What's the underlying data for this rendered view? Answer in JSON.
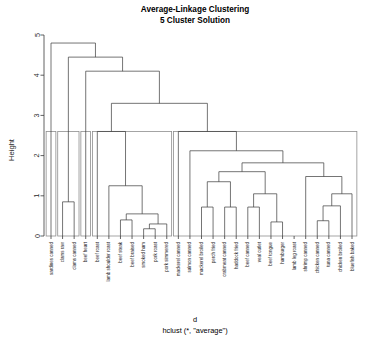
{
  "title": {
    "line1": "Average-Linkage Clustering",
    "line2": "5 Cluster Solution"
  },
  "footer": {
    "xlabel": "d",
    "method": "hclust (*, \"average\")"
  },
  "colors": {
    "branch": "#3a3a3a",
    "cluster_box": "#8e8e8e",
    "axis": "#3a3a3a",
    "text": "#000000",
    "background": "#ffffff"
  },
  "chart_data": {
    "type": "dendrogram",
    "xlabel": "d",
    "ylabel": "Height",
    "ylim": [
      0,
      5
    ],
    "yticks": [
      0,
      1,
      2,
      3,
      4,
      5
    ],
    "grid": false,
    "legend": "none",
    "linkage": "average",
    "n_clusters": 5,
    "n_leaves": 27,
    "cut_height": 2.6,
    "leaves": [
      "sardines canned",
      "clams raw",
      "clams canned",
      "beef heart",
      "beef roast",
      "lamb shoulder roast",
      "beef steak",
      "beef braised",
      "smoked ham",
      "pork roast",
      "pork simmered",
      "mackerel canned",
      "salmon canned",
      "mackerel broiled",
      "perch fried",
      "crabmeat canned",
      "haddock fried",
      "beef canned",
      "veal cutlet",
      "beef tongue",
      "hamburger",
      "lamb leg roast",
      "shrimp canned",
      "chicken canned",
      "tuna canned",
      "chicken broiled",
      "bluefish baked"
    ],
    "clusters": [
      {
        "id": 1,
        "label": "cluster-1",
        "leaf_start": 0,
        "leaf_end": 0,
        "members": [
          "sardines canned"
        ]
      },
      {
        "id": 2,
        "label": "cluster-2",
        "leaf_start": 1,
        "leaf_end": 2,
        "members": [
          "clams raw",
          "clams canned"
        ]
      },
      {
        "id": 3,
        "label": "cluster-3",
        "leaf_start": 3,
        "leaf_end": 3,
        "members": [
          "beef heart"
        ]
      },
      {
        "id": 4,
        "label": "cluster-4",
        "leaf_start": 4,
        "leaf_end": 10,
        "members": [
          "beef roast",
          "lamb shoulder roast",
          "beef steak",
          "beef braised",
          "smoked ham",
          "pork roast",
          "pork simmered"
        ]
      },
      {
        "id": 5,
        "label": "cluster-5",
        "leaf_start": 11,
        "leaf_end": 26,
        "members": [
          "mackerel canned",
          "salmon canned",
          "mackerel broiled",
          "perch fried",
          "crabmeat canned",
          "haddock fried",
          "beef canned",
          "veal cutlet",
          "beef tongue",
          "hamburger",
          "lamb leg roast",
          "shrimp canned",
          "chicken canned",
          "tuna canned",
          "chicken broiled",
          "bluefish baked"
        ]
      }
    ],
    "merges": [
      {
        "id": "m1",
        "left": {
          "type": "leaf",
          "index": 1
        },
        "right": {
          "type": "leaf",
          "index": 2
        },
        "height": 0.85
      },
      {
        "id": "m2",
        "left": {
          "type": "leaf",
          "index": 6
        },
        "right": {
          "type": "leaf",
          "index": 7
        },
        "height": 0.4
      },
      {
        "id": "m3",
        "left": {
          "type": "leaf",
          "index": 8
        },
        "right": {
          "type": "leaf",
          "index": 9
        },
        "height": 0.18
      },
      {
        "id": "m4",
        "left": {
          "type": "node",
          "ref": "m3"
        },
        "right": {
          "type": "leaf",
          "index": 10
        },
        "height": 0.3
      },
      {
        "id": "m5",
        "left": {
          "type": "node",
          "ref": "m2"
        },
        "right": {
          "type": "node",
          "ref": "m4"
        },
        "height": 0.55
      },
      {
        "id": "m6",
        "left": {
          "type": "leaf",
          "index": 5
        },
        "right": {
          "type": "node",
          "ref": "m5"
        },
        "height": 1.25
      },
      {
        "id": "m7",
        "left": {
          "type": "leaf",
          "index": 4
        },
        "right": {
          "type": "node",
          "ref": "m6"
        },
        "height": 2.6
      },
      {
        "id": "m8",
        "left": {
          "type": "leaf",
          "index": 13
        },
        "right": {
          "type": "leaf",
          "index": 14
        },
        "height": 0.72
      },
      {
        "id": "m9",
        "left": {
          "type": "leaf",
          "index": 15
        },
        "right": {
          "type": "leaf",
          "index": 16
        },
        "height": 0.72
      },
      {
        "id": "m10",
        "left": {
          "type": "node",
          "ref": "m8"
        },
        "right": {
          "type": "node",
          "ref": "m9"
        },
        "height": 1.35
      },
      {
        "id": "m11",
        "left": {
          "type": "leaf",
          "index": 17
        },
        "right": {
          "type": "leaf",
          "index": 18
        },
        "height": 0.72
      },
      {
        "id": "m12",
        "left": {
          "type": "leaf",
          "index": 19
        },
        "right": {
          "type": "leaf",
          "index": 20
        },
        "height": 0.35
      },
      {
        "id": "m13",
        "left": {
          "type": "node",
          "ref": "m11"
        },
        "right": {
          "type": "node",
          "ref": "m12"
        },
        "height": 1.05
      },
      {
        "id": "m14",
        "left": {
          "type": "node",
          "ref": "m10"
        },
        "right": {
          "type": "node",
          "ref": "m13"
        },
        "height": 1.6
      },
      {
        "id": "m15",
        "left": {
          "type": "leaf",
          "index": 23
        },
        "right": {
          "type": "leaf",
          "index": 24
        },
        "height": 0.38
      },
      {
        "id": "m16",
        "left": {
          "type": "node",
          "ref": "m15"
        },
        "right": {
          "type": "leaf",
          "index": 25
        },
        "height": 0.75
      },
      {
        "id": "m17",
        "left": {
          "type": "node",
          "ref": "m16"
        },
        "right": {
          "type": "leaf",
          "index": 26
        },
        "height": 1.05
      },
      {
        "id": "m18",
        "left": {
          "type": "leaf",
          "index": 22
        },
        "right": {
          "type": "node",
          "ref": "m17"
        },
        "height": 1.48
      },
      {
        "id": "m19",
        "left": {
          "type": "node",
          "ref": "m14"
        },
        "right": {
          "type": "node",
          "ref": "m18"
        },
        "height": 1.82
      },
      {
        "id": "m20",
        "left": {
          "type": "leaf",
          "index": 12
        },
        "right": {
          "type": "node",
          "ref": "m19"
        },
        "height": 2.12
      },
      {
        "id": "m21",
        "left": {
          "type": "leaf",
          "index": 11
        },
        "right": {
          "type": "node",
          "ref": "m20"
        },
        "height": 2.6
      },
      {
        "id": "m22",
        "left": {
          "type": "node",
          "ref": "m7"
        },
        "right": {
          "type": "node",
          "ref": "m21"
        },
        "height": 3.3
      },
      {
        "id": "m23",
        "left": {
          "type": "leaf",
          "index": 3
        },
        "right": {
          "type": "node",
          "ref": "m22"
        },
        "height": 4.1
      },
      {
        "id": "m24",
        "left": {
          "type": "node",
          "ref": "m1"
        },
        "right": {
          "type": "node",
          "ref": "m23"
        },
        "height": 4.45
      },
      {
        "id": "m25",
        "left": {
          "type": "leaf",
          "index": 0
        },
        "right": {
          "type": "node",
          "ref": "m24"
        },
        "height": 4.8
      }
    ]
  }
}
